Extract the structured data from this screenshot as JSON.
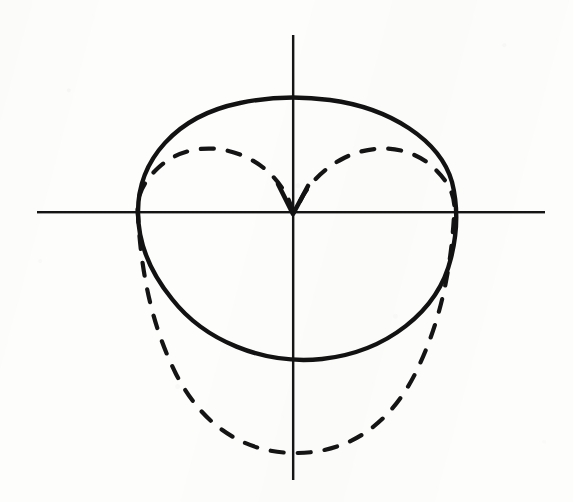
{
  "figure": {
    "kind": "polar-plot",
    "background_color": "#fdfdfc",
    "ink_color": "#121212"
  },
  "axes": {
    "origin": {
      "x": 293,
      "y": 212
    },
    "x_axis": {
      "name": "horizontal-axis",
      "x1": 37,
      "y1": 212,
      "x2": 545,
      "y2": 212,
      "stroke": "#151515",
      "width": 2.1
    },
    "y_axis": {
      "name": "vertical-axis",
      "x1": 293,
      "y1": 35,
      "x2": 293,
      "y2": 480,
      "stroke": "#151515",
      "width": 2.1
    },
    "tick_labels": [],
    "axis_labels": []
  },
  "curves": [
    {
      "id": "solid-oval-curve",
      "label": "solid curve",
      "style": "solid",
      "stroke": "#121212",
      "stroke_width": 4.4,
      "closed": true,
      "extents": {
        "left_x": 138,
        "right_x": 455,
        "top_y": 98,
        "bottom_y": 360
      },
      "path": "M 138 212 C 138 160, 176 116, 240 103 C 268 97, 300 96, 330 100 C 390 108, 440 140, 452 182 C 458 206, 457 234, 451 258 C 438 312, 386 352, 322 359 C 262 365, 204 340, 172 299 C 150 272, 138 242, 138 212 Z"
    },
    {
      "id": "dashed-cardioid-curve",
      "label": "dashed curve",
      "style": "dashed",
      "stroke": "#141414",
      "stroke_width": 4.2,
      "dash_pattern": "13 14",
      "closed": true,
      "cusp_at_origin": true,
      "extents": {
        "left_x": 138,
        "right_x": 455,
        "top_y": 150,
        "bottom_y": 453
      },
      "path": "M 293 212 C 289 196, 276 172, 248 158 C 216 142, 180 147, 158 168 C 140 185, 136 200, 138 216 C 141 268, 150 322, 176 374 C 204 428, 246 453, 296 453 C 346 453, 388 427, 415 374 C 441 322, 451 268, 454 216 C 456 200, 452 185, 434 168 C 412 147, 376 142, 344 158 C 316 172, 300 196, 296 212 Z"
    }
  ],
  "annotations": {
    "cusp": {
      "name": "cusp-at-origin",
      "x": 293,
      "y": 212,
      "note": "Dashed curve meets itself in a downward V at the origin"
    }
  },
  "text_content": []
}
